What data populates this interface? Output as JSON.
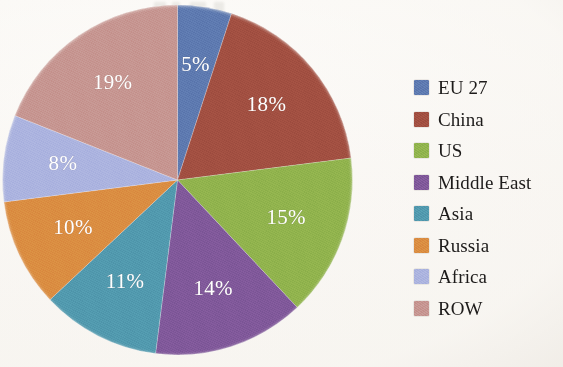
{
  "chart_data": {
    "type": "pie",
    "title": "",
    "subtitle": "",
    "xlabel": "",
    "ylabel": "",
    "legend_position": "right",
    "grid": false,
    "units": "percent",
    "start_angle_deg": 0,
    "direction": "clockwise",
    "categories": [
      "EU 27",
      "China",
      "US",
      "Middle East",
      "Asia",
      "Russia",
      "Africa",
      "ROW"
    ],
    "values": [
      5,
      18,
      15,
      14,
      11,
      10,
      8,
      19
    ],
    "data_labels": [
      "5%",
      "18%",
      "15%",
      "14%",
      "11%",
      "10%",
      "8%",
      "19%"
    ],
    "colors": [
      "#5a75ad",
      "#9e4c3f",
      "#8cb04a",
      "#7b5596",
      "#4e95ab",
      "#d9883f",
      "#a8b0de",
      "#c4918c"
    ],
    "slices": [
      {
        "label": "EU 27",
        "value": 5,
        "data_label": "5%",
        "color": "#5a75ad"
      },
      {
        "label": "China",
        "value": 18,
        "data_label": "18%",
        "color": "#9e4c3f"
      },
      {
        "label": "US",
        "value": 15,
        "data_label": "15%",
        "color": "#8cb04a"
      },
      {
        "label": "Middle East",
        "value": 14,
        "data_label": "14%",
        "color": "#7b5596"
      },
      {
        "label": "Asia",
        "value": 11,
        "data_label": "11%",
        "color": "#4e95ab"
      },
      {
        "label": "Russia",
        "value": 10,
        "data_label": "10%",
        "color": "#d9883f"
      },
      {
        "label": "Africa",
        "value": 8,
        "data_label": "8%",
        "color": "#a8b0de"
      },
      {
        "label": "ROW",
        "value": 19,
        "data_label": "19%",
        "color": "#c4918c"
      }
    ]
  },
  "legend": {
    "items": [
      {
        "label": "EU 27",
        "color": "#5a75ad"
      },
      {
        "label": "China",
        "color": "#9e4c3f"
      },
      {
        "label": "US",
        "color": "#8cb04a"
      },
      {
        "label": "Middle East",
        "color": "#7b5596"
      },
      {
        "label": "Asia",
        "color": "#4e95ab"
      },
      {
        "label": "Russia",
        "color": "#d9883f"
      },
      {
        "label": "Africa",
        "color": "#a8b0de"
      },
      {
        "label": "ROW",
        "color": "#c4918c"
      }
    ]
  },
  "canvas": {
    "background": "#fdfcfa",
    "pie_center_x": 177,
    "pie_center_y": 180,
    "pie_radius": 175,
    "label_radius_fraction": 0.66
  }
}
